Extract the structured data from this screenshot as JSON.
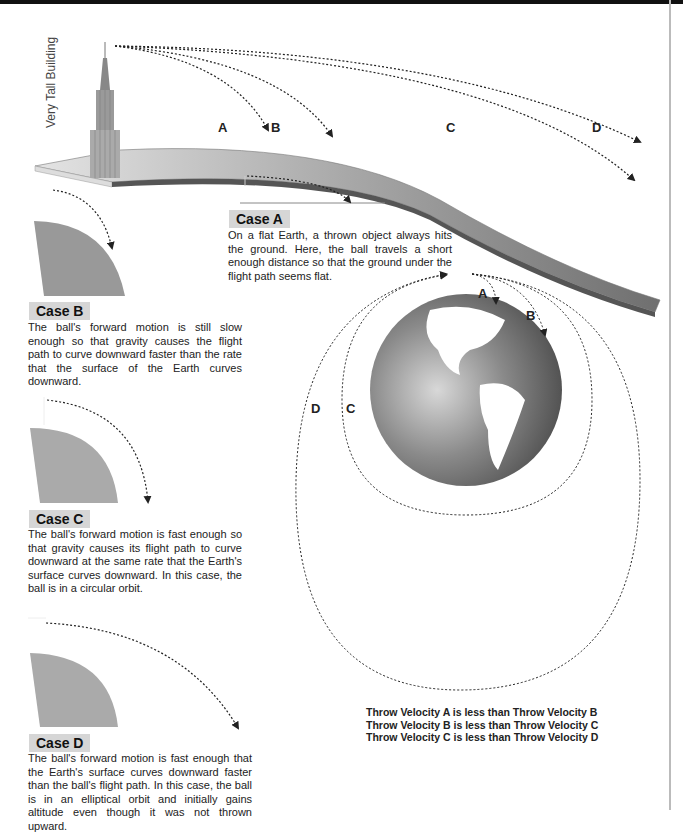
{
  "building": {
    "label": "Very Tall Building"
  },
  "top_paths": {
    "labels": [
      "A",
      "B",
      "C",
      "D"
    ]
  },
  "cases": [
    {
      "title": "Case A",
      "text": "On a flat Earth, a thrown object always hits the ground. Here, the ball travels a short enough distance so that the ground under the flight path seems flat."
    },
    {
      "title": "Case B",
      "text": "The ball's forward motion is still slow enough so that gravity causes the flight path to curve downward faster than the rate that the surface of the Earth curves downward."
    },
    {
      "title": "Case C",
      "text": "The ball's forward motion is fast enough so that gravity causes its flight path to curve downward at the same rate that the Earth's surface curves downward. In this case, the ball is in a circular orbit."
    },
    {
      "title": "Case D",
      "text": "The ball's forward motion is fast enough that the Earth's surface curves downward faster than the ball's flight path. In this case, the ball is in an elliptical orbit and initially gains altitude even though it was not thrown upward."
    }
  ],
  "globe_paths": {
    "labels": [
      "A",
      "B",
      "C",
      "D"
    ]
  },
  "summary": [
    "Throw Velocity A is less than Throw Velocity B",
    "Throw Velocity B is less than Throw Velocity C",
    "Throw Velocity C is less than Throw Velocity D"
  ]
}
